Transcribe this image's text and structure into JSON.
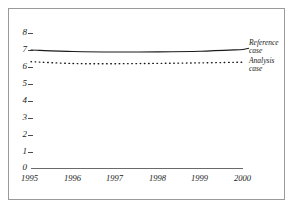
{
  "figure": {
    "background_color": "#ffffff",
    "frame_color": "#9a9a9a",
    "axis_color": "#555555",
    "series_color": "#1a1a1a"
  },
  "chart_data": {
    "type": "line",
    "title": "",
    "subtitle": "",
    "xlabel": "",
    "ylabel": "",
    "x": [
      1995,
      1996,
      1997,
      1998,
      1999,
      2000
    ],
    "xlim": [
      1995,
      2000
    ],
    "ylim": [
      0,
      8
    ],
    "yticks": [
      0,
      1,
      2,
      3,
      4,
      5,
      6,
      7,
      8
    ],
    "ytick_labels": [
      "0",
      "1",
      "2",
      "3",
      "4",
      "5",
      "6",
      "7",
      "8"
    ],
    "xtick_labels": [
      "1995",
      "1996",
      "1997",
      "1998",
      "1999",
      "2000"
    ],
    "grid": false,
    "legend_position": "right-inline",
    "series": [
      {
        "name": "Reference case",
        "style": "solid",
        "color": "#1a1a1a",
        "values": [
          7.02,
          6.93,
          6.9,
          6.91,
          6.95,
          7.05
        ],
        "label_line1": "Reference",
        "label_line2": "case"
      },
      {
        "name": "Analysis case",
        "style": "dotted",
        "color": "#1a1a1a",
        "values": [
          6.33,
          6.22,
          6.21,
          6.23,
          6.26,
          6.3
        ],
        "label_line1": "Analysis",
        "label_line2": "case"
      }
    ]
  },
  "legend": {
    "reference": {
      "line1": "Reference",
      "line2": "case"
    },
    "analysis": {
      "line1": "Analysis",
      "line2": "case"
    }
  },
  "yaxis": {
    "t8": "8",
    "t7": "7",
    "t6": "6",
    "t5": "5",
    "t4": "4",
    "t3": "3",
    "t2": "2",
    "t1": "1",
    "t0": "0"
  },
  "xaxis": {
    "t1995": "1995",
    "t1996": "1996",
    "t1997": "1997",
    "t1998": "1998",
    "t1999": "1999",
    "t2000": "2000"
  }
}
